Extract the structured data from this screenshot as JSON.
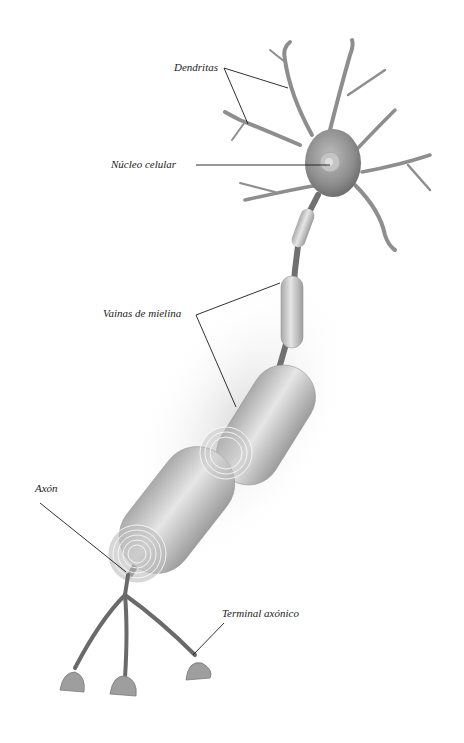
{
  "diagram": {
    "labels": {
      "dendrites": "Dendritas",
      "nucleus": "Núcleo celular",
      "myelin": "Vainas de mielina",
      "axon": "Axón",
      "terminal": "Terminal axónico"
    },
    "colors": {
      "background": "#ffffff",
      "cell": "#9a9a9a",
      "cell_dark": "#6f6f6f",
      "myelin": "#c8c8c8",
      "leader_line": "#1a1a1a"
    }
  }
}
